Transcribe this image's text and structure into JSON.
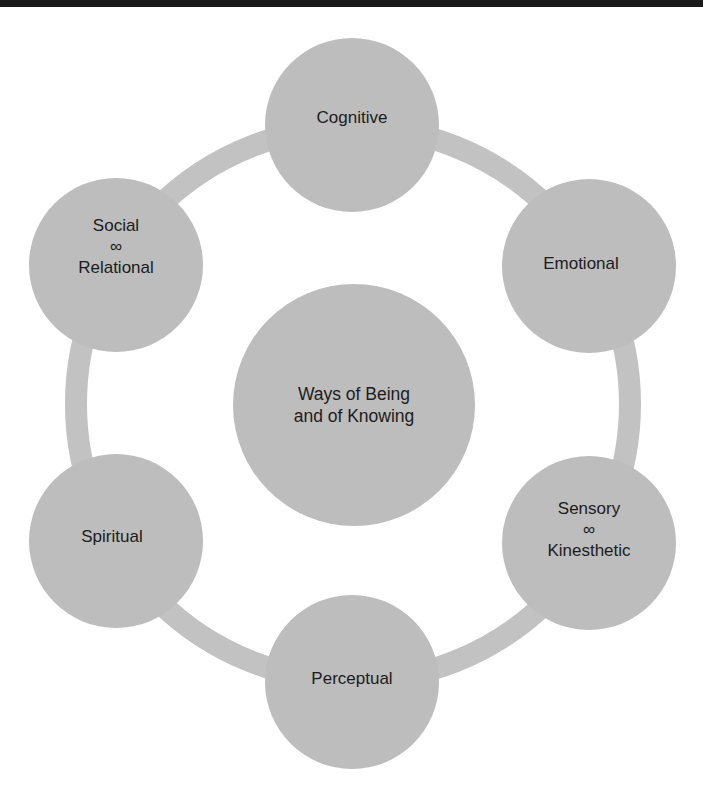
{
  "colors": {
    "fill": "#bdbdbd",
    "ring": "#c2c2c2",
    "text": "#1c1c1c",
    "top_bar": "#1a1a1a",
    "background": "#ffffff"
  },
  "diagram": {
    "center": {
      "line1": "Ways of Being",
      "line2": "and of Knowing"
    },
    "nodes": [
      {
        "id": "cognitive",
        "line1": "Cognitive"
      },
      {
        "id": "emotional",
        "line1": "Emotional"
      },
      {
        "id": "sensory-kinesthetic",
        "line1": "Sensory",
        "symbol": "∞",
        "line2": "Kinesthetic"
      },
      {
        "id": "perceptual",
        "line1": "Perceptual"
      },
      {
        "id": "spiritual",
        "line1": "Spiritual"
      },
      {
        "id": "social-relational",
        "line1": "Social",
        "symbol": "∞",
        "line2": "Relational"
      }
    ]
  }
}
